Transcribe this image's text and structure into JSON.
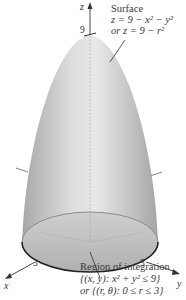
{
  "figure": {
    "type": "3d-surface-diagram",
    "axes": {
      "x": "x",
      "y": "y",
      "z": "z"
    },
    "ticks": {
      "z": "9",
      "x": "3",
      "y": "3"
    },
    "surface_label": {
      "title": "Surface",
      "line1": "z = 9 − x² − y²",
      "line2": "or z = 9 − r²"
    },
    "region_label": {
      "title": "Region of integration",
      "line1": "{(x, y): x² + y² ≤ 9}",
      "line2": "or {(r, θ): 0 ≤ r ≤ 3}"
    },
    "colors": {
      "surface_light": "#e6e6e6",
      "surface_dark": "#a9a9a9",
      "base_disk": "#b8b8b8",
      "outline": "#222222",
      "axis": "#444444"
    }
  }
}
